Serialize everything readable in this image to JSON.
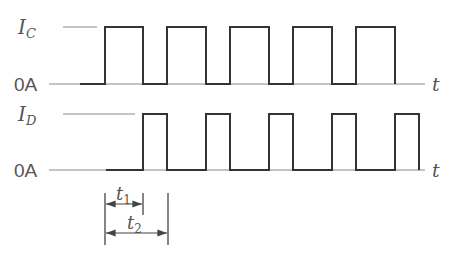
{
  "diagram": {
    "type": "timing-diagram",
    "signals": [
      {
        "name": "I_C",
        "label_main": "I",
        "label_sub": "C",
        "zero_label": "0A",
        "axis_label": "t",
        "high_y": 27,
        "low_y": 84,
        "ref_line": [
          63,
          97
        ],
        "baseline_start": 49,
        "baseline_end": 425,
        "low_start": 80,
        "pulses": [
          [
            105,
            143
          ],
          [
            167,
            206
          ],
          [
            230,
            269
          ],
          [
            293,
            332
          ],
          [
            356,
            395
          ]
        ]
      },
      {
        "name": "I_D",
        "label_main": "I",
        "label_sub": "D",
        "zero_label": "0A",
        "axis_label": "t",
        "high_y": 114,
        "low_y": 170,
        "ref_line": [
          63,
          135
        ],
        "baseline_start": 49,
        "baseline_end": 425,
        "low_start": 106,
        "pulses": [
          [
            143,
            167
          ],
          [
            206,
            230
          ],
          [
            269,
            293
          ],
          [
            332,
            356
          ],
          [
            395,
            419
          ]
        ]
      }
    ],
    "dimensions": [
      {
        "label_main": "t",
        "label_sub": "1",
        "from_x": 105,
        "to_x": 143,
        "y": 204
      },
      {
        "label_main": "t",
        "label_sub": "2",
        "from_x": 105,
        "to_x": 168,
        "y": 233
      }
    ]
  }
}
